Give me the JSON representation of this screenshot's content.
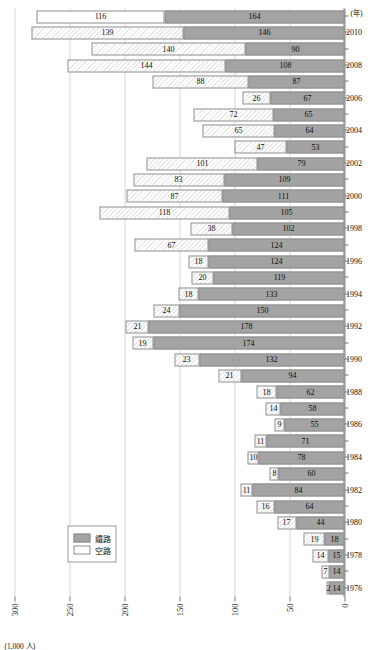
{
  "chart_data": {
    "type": "bar",
    "orientation": "vertical-stacked-rendered-rotated",
    "title": "",
    "subtitle": "",
    "xlabel": "",
    "ylabel": "",
    "unit_label": "(1,000 人)",
    "axis_suffix_label": "(年)",
    "ylim": [
      0,
      300
    ],
    "yticks": [
      0,
      50,
      100,
      150,
      200,
      250,
      300
    ],
    "ytick_labels": [
      "0",
      "50",
      "100",
      "150",
      "200",
      "250",
      "300"
    ],
    "grid": true,
    "legend_position": "lower-left",
    "categories": [
      "1976",
      "1977",
      "1978",
      "1979",
      "1980",
      "1981",
      "1982",
      "1983",
      "1984",
      "1985",
      "1986",
      "1987",
      "1988",
      "1989",
      "1990",
      "1991",
      "1992",
      "1993",
      "1994",
      "1995",
      "1996",
      "1997",
      "1998",
      "1999",
      "2000",
      "2001",
      "2002",
      "2003",
      "2004",
      "2005",
      "2006",
      "2007",
      "2008",
      "2009",
      "2010",
      "2011"
    ],
    "category_tick_labels": [
      "1976",
      "1978",
      "1980",
      "1982",
      "1984",
      "1986",
      "1988",
      "1990",
      "1992",
      "1994",
      "1996",
      "1998",
      "2000",
      "2002",
      "2004",
      "2006",
      "2008",
      "2010"
    ],
    "series": [
      {
        "name": "鐵路",
        "key": "rail",
        "color": "#a3a3a3",
        "values": [
          14,
          14,
          15,
          18,
          44,
          64,
          84,
          60,
          78,
          71,
          55,
          58,
          62,
          94,
          132,
          174,
          178,
          150,
          133,
          119,
          124,
          124,
          102,
          105,
          111,
          109,
          79,
          53,
          64,
          65,
          67,
          87,
          108,
          90,
          146,
          164
        ]
      },
      {
        "name": "空路",
        "key": "air",
        "color": "#ffffff",
        "values": [
          2,
          7,
          14,
          19,
          17,
          16,
          11,
          8,
          10,
          11,
          9,
          14,
          18,
          21,
          23,
          19,
          21,
          24,
          18,
          20,
          18,
          67,
          38,
          118,
          87,
          83,
          101,
          47,
          65,
          72,
          26,
          88,
          144,
          140,
          139,
          116
        ]
      }
    ]
  },
  "legend": {
    "items": [
      {
        "label": "鐵路",
        "swatch": "rail"
      },
      {
        "label": "空路",
        "swatch": "air"
      }
    ]
  }
}
